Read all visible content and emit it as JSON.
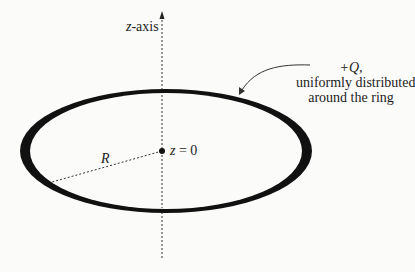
{
  "diagram": {
    "axis": {
      "label_var": "z",
      "label_suffix": "-axis"
    },
    "origin": {
      "label_var": "z",
      "label_rest": " = 0"
    },
    "radius": {
      "label": "R"
    },
    "charge": {
      "line1": "+Q,",
      "line2": "uniformly distributed",
      "line3": "around the ring"
    },
    "colors": {
      "ring": "#111111",
      "axis": "#333333",
      "background": "#fbfbfa"
    }
  }
}
